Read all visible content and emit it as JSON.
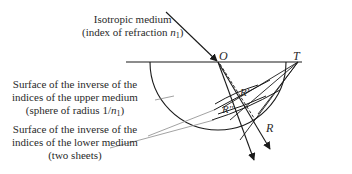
{
  "labels": {
    "upper_medium_line1": "Isotropic medium",
    "upper_medium_line2_prefix": "(index of refraction ",
    "upper_medium_n": "n",
    "upper_medium_sub": "1",
    "upper_medium_suffix": ")",
    "upper_surface_line1": "Surface of the inverse of the",
    "upper_surface_line2": "indices of the upper medium",
    "upper_surface_line3_prefix": "(sphere of radius 1/",
    "upper_surface_n": "n",
    "upper_surface_sub": "1",
    "upper_surface_suffix": ")",
    "lower_surface_line1": "Surface of the inverse of the",
    "lower_surface_line2": "indices of the lower medium",
    "lower_surface_line3": "(two sheets)"
  },
  "points": {
    "O": "O",
    "T": "T",
    "R": "R",
    "R_prime": "R'",
    "R_double_prime": "R''"
  },
  "colors": {
    "line": "#1a1a1a",
    "leader": "#8a8a8a",
    "text": "#2a2a2a"
  }
}
